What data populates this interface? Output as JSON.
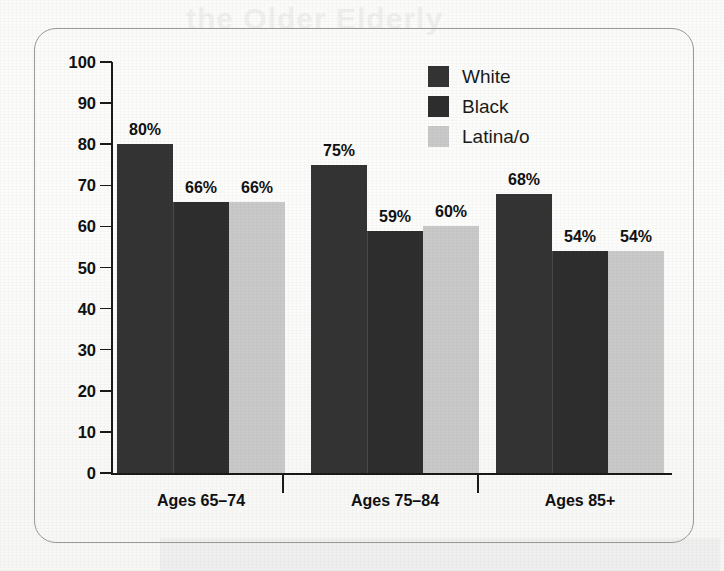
{
  "chart_data": {
    "type": "bar",
    "title": "",
    "xlabel": "",
    "ylabel": "",
    "ylim": [
      0,
      100
    ],
    "yticks": [
      0,
      10,
      20,
      30,
      40,
      50,
      60,
      70,
      80,
      90,
      100
    ],
    "grid": false,
    "legend_position": "top-right",
    "categories": [
      "Ages 65–74",
      "Ages 75–84",
      "Ages 85+"
    ],
    "series": [
      {
        "name": "White",
        "values": [
          80,
          75,
          68
        ],
        "color": "#343434"
      },
      {
        "name": "Black",
        "values": [
          66,
          59,
          54
        ],
        "color": "#2e2e2e"
      },
      {
        "name": "Latina/o",
        "values": [
          66,
          60,
          54
        ],
        "color": "#c9c9c9"
      }
    ],
    "data_labels": [
      [
        "80%",
        "66%",
        "66%"
      ],
      [
        "75%",
        "59%",
        "60%"
      ],
      [
        "68%",
        "54%",
        "54%"
      ]
    ]
  },
  "legend": {
    "items": [
      {
        "label": "White",
        "swatch": "legend-swatch-white"
      },
      {
        "label": "Black",
        "swatch": "legend-swatch-black"
      },
      {
        "label": "Latina/o",
        "swatch": "legend-swatch-latino"
      }
    ]
  },
  "axis": {
    "y_tick_labels": [
      "100",
      "90",
      "80",
      "70",
      "60",
      "50",
      "40",
      "30",
      "20",
      "10",
      "0"
    ]
  },
  "background": {
    "ghost_title": "the Older Elderly"
  },
  "colors": {
    "series_white": "#343434",
    "series_black": "#2e2e2e",
    "series_latino": "#c9c9c9",
    "axis": "#1a1a1a",
    "frame": "#9a9a9a",
    "paper": "#fbfbfa"
  }
}
